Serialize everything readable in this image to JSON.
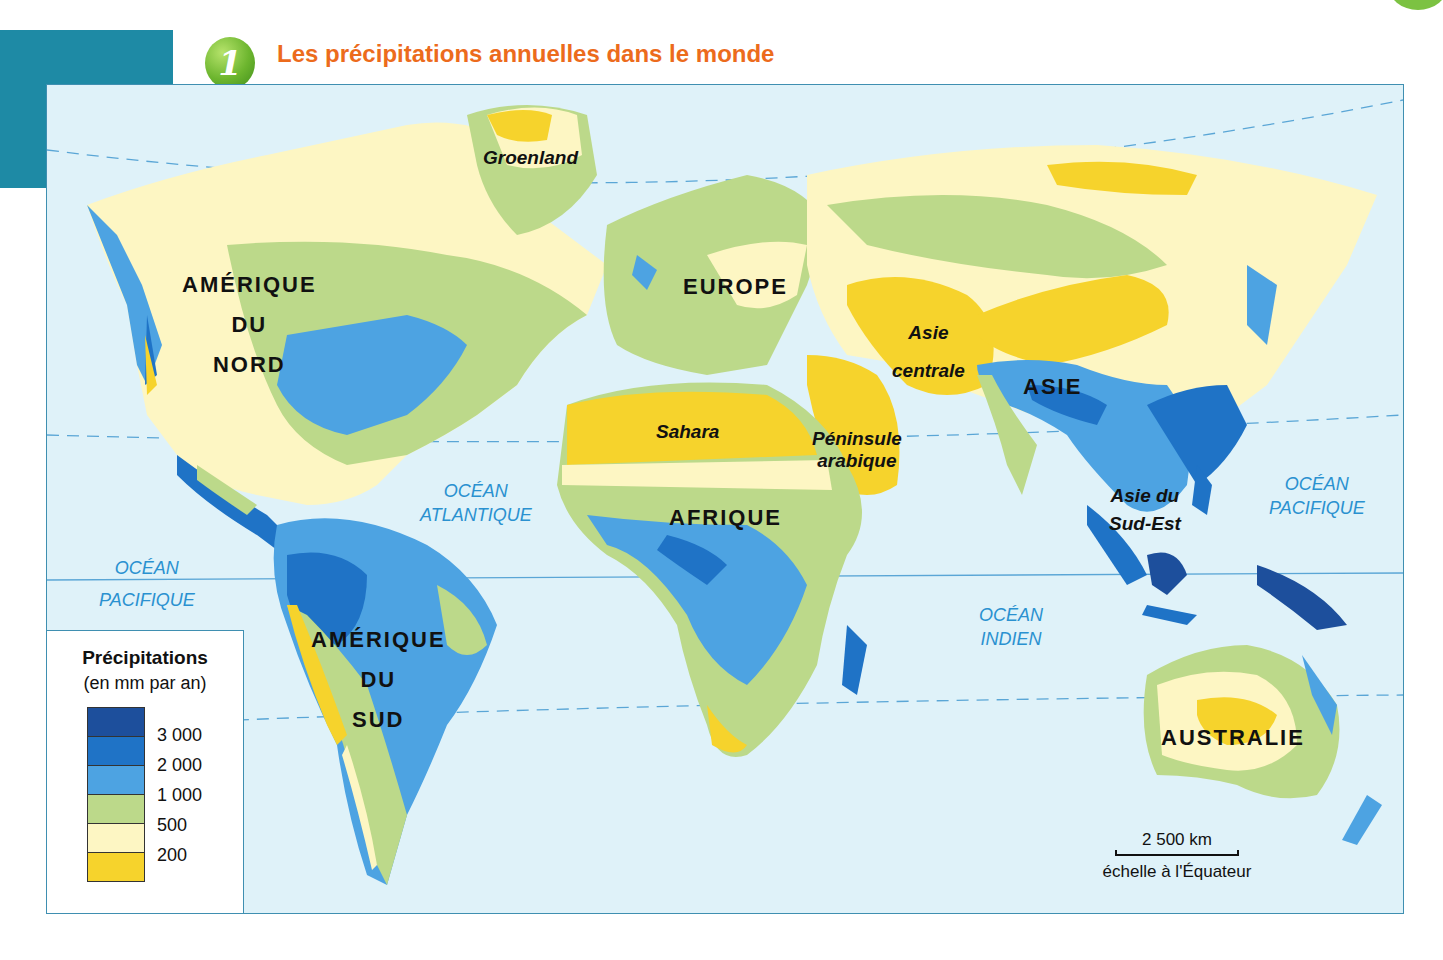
{
  "header": {
    "badge_number": "1",
    "title": "Les précipitations annuelles dans le monde",
    "title_color": "#ec6b1c"
  },
  "map": {
    "continents": [
      {
        "id": "amerique-du-nord",
        "lines": [
          "AMÉRIQUE",
          "DU",
          "NORD"
        ]
      },
      {
        "id": "amerique-du-sud",
        "lines": [
          "AMÉRIQUE",
          "DU",
          "SUD"
        ]
      },
      {
        "id": "europe",
        "lines": [
          "EUROPE"
        ]
      },
      {
        "id": "afrique",
        "lines": [
          "AFRIQUE"
        ]
      },
      {
        "id": "asie",
        "lines": [
          "ASIE"
        ]
      },
      {
        "id": "australie",
        "lines": [
          "AUSTRALIE"
        ]
      }
    ],
    "regions": [
      {
        "id": "groenland",
        "lines": [
          "Groenland"
        ]
      },
      {
        "id": "sahara",
        "lines": [
          "Sahara"
        ]
      },
      {
        "id": "peninsule-arabique",
        "lines": [
          "Péninsule",
          "arabique"
        ]
      },
      {
        "id": "asie-centrale",
        "lines": [
          "Asie",
          "centrale"
        ]
      },
      {
        "id": "asie-du-sud-est",
        "lines": [
          "Asie du",
          "Sud-Est"
        ]
      }
    ],
    "oceans": [
      {
        "id": "ocean-atlantique",
        "lines": [
          "OCÉAN",
          "ATLANTIQUE"
        ]
      },
      {
        "id": "ocean-pacifique-west",
        "lines": [
          "OCÉAN",
          "PACIFIQUE"
        ]
      },
      {
        "id": "ocean-pacifique-east",
        "lines": [
          "OCÉAN",
          "PACIFIQUE"
        ]
      },
      {
        "id": "ocean-indien",
        "lines": [
          "OCÉAN",
          "INDIEN"
        ]
      }
    ],
    "scale": {
      "distance": "2 500 km",
      "caption": "échelle à l'Équateur"
    }
  },
  "legend": {
    "title": "Précipitations",
    "subtitle": "(en mm par an)",
    "classes": [
      {
        "label": "> 3 000",
        "color": "#1d4f9c"
      },
      {
        "label": "2 000 – 3 000",
        "color": "#1f73c6"
      },
      {
        "label": "1 000 – 2 000",
        "color": "#4da3e2"
      },
      {
        "label": "500 – 1 000",
        "color": "#bcd98a"
      },
      {
        "label": "200 – 500",
        "color": "#fdf6c3"
      },
      {
        "label": "< 200",
        "color": "#f6d32c"
      }
    ],
    "ticks": [
      "3 000",
      "2 000",
      "1 000",
      "500",
      "200"
    ]
  },
  "colors": {
    "ocean": "#dff2f9",
    "frame": "#3f8fb1",
    "teal_block": "#1e8aa5",
    "ocean_label": "#2a91d0"
  }
}
